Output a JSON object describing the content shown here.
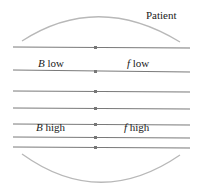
{
  "diagram": {
    "title_label": "Patient",
    "labels": {
      "low_left_var": "B",
      "low_left_text": " low",
      "low_right_var": "f",
      "low_right_text": " low",
      "high_left_var": "B",
      "high_left_text": " high",
      "high_right_var": "f",
      "high_right_text": " high"
    },
    "field_lines_y": [
      47,
      71,
      92,
      109,
      125,
      137,
      148
    ],
    "colors": {
      "line": "#7a7a7a",
      "arc": "#b8b8b8",
      "text": "#222222"
    }
  }
}
